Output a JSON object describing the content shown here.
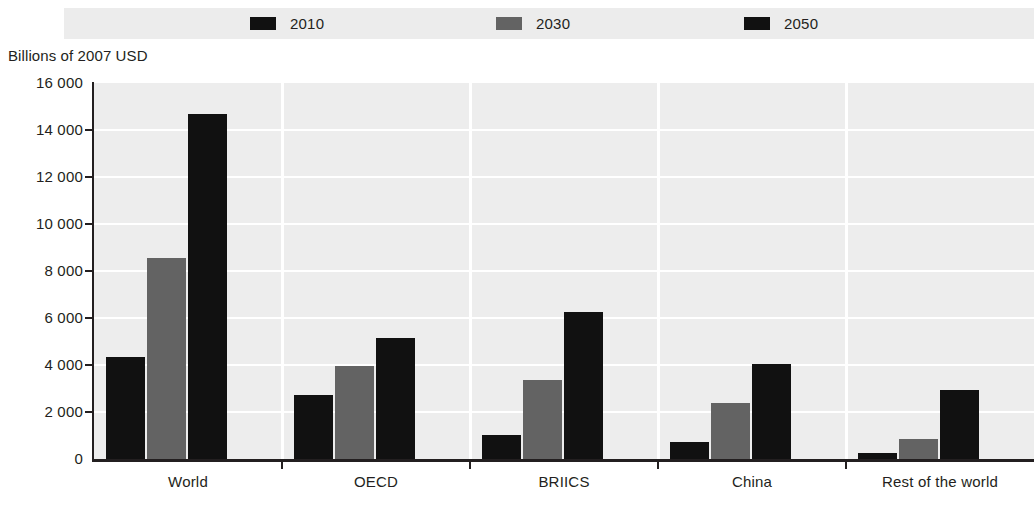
{
  "legend": {
    "entries": [
      {
        "label": "2010",
        "color": "#111111",
        "swatch_name": "legend-swatch-2010"
      },
      {
        "label": "2030",
        "color": "#636363",
        "swatch_name": "legend-swatch-2030"
      },
      {
        "label": "2050",
        "color": "#111111",
        "swatch_name": "legend-swatch-2050"
      }
    ]
  },
  "axis": {
    "y_title": "Billions of 2007 USD",
    "y_ticks": [
      "16 000",
      "14 000",
      "12 000",
      "10 000",
      "8 000",
      "6 000",
      "4 000",
      "2 000",
      "0"
    ]
  },
  "chart_data": {
    "type": "bar",
    "title": "",
    "subtitle": "",
    "xlabel": "",
    "ylabel": "Billions of 2007 USD",
    "ylim": [
      0,
      16000
    ],
    "ytick_values": [
      0,
      2000,
      4000,
      6000,
      8000,
      10000,
      12000,
      14000,
      16000
    ],
    "ytick_labels": [
      "0",
      "2 000",
      "4 000",
      "6 000",
      "8 000",
      "10 000",
      "12 000",
      "14 000",
      "16 000"
    ],
    "grid": "horizontal-white-on-gray",
    "legend_position": "top-center",
    "categories": [
      "World",
      "OECD",
      "BRIICS",
      "China",
      "Rest of the world"
    ],
    "series": [
      {
        "name": "2010",
        "color": "#111111",
        "values": [
          4340,
          2720,
          1030,
          720,
          240
        ]
      },
      {
        "name": "2030",
        "color": "#636363",
        "values": [
          8550,
          3950,
          3350,
          2380,
          870
        ]
      },
      {
        "name": "2050",
        "color": "#111111",
        "values": [
          14700,
          5140,
          6270,
          4060,
          2930
        ]
      }
    ]
  }
}
